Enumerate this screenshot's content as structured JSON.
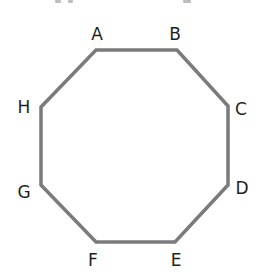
{
  "diagram": {
    "type": "regular-octagon",
    "stroke_color": "#7b7b7b",
    "stroke_width": 3.5,
    "fill": "none",
    "label_color": "#231f20",
    "vertices": [
      {
        "label": "A",
        "x": 96,
        "y": 50,
        "label_x": 97,
        "label_y": 34
      },
      {
        "label": "B",
        "x": 177,
        "y": 50,
        "label_x": 175,
        "label_y": 34
      },
      {
        "label": "C",
        "x": 228,
        "y": 106,
        "label_x": 241,
        "label_y": 109
      },
      {
        "label": "D",
        "x": 228,
        "y": 185,
        "label_x": 242,
        "label_y": 188
      },
      {
        "label": "E",
        "x": 175,
        "y": 242,
        "label_x": 176,
        "label_y": 260
      },
      {
        "label": "F",
        "x": 96,
        "y": 242,
        "label_x": 93,
        "label_y": 260
      },
      {
        "label": "G",
        "x": 41,
        "y": 185,
        "label_x": 24,
        "label_y": 192
      },
      {
        "label": "H",
        "x": 41,
        "y": 107,
        "label_x": 24,
        "label_y": 107
      }
    ]
  }
}
